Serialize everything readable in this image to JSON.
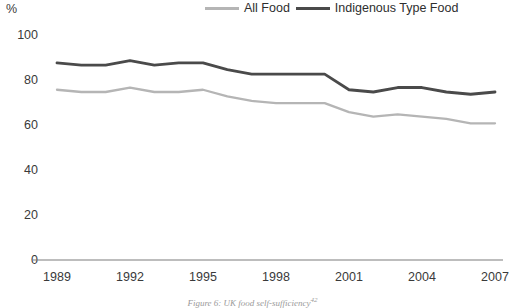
{
  "axis": {
    "unit_label": "%",
    "y_ticks": [
      "100",
      "80",
      "60",
      "40",
      "20",
      "0"
    ],
    "x_ticks": [
      "1989",
      "1992",
      "1995",
      "1998",
      "2001",
      "2004",
      "2007"
    ]
  },
  "legend": {
    "items": [
      {
        "label": "All Food",
        "color": "#b5b5b5",
        "icon": "line-swatch-light"
      },
      {
        "label": "Indigenous Type Food",
        "color": "#4a4a4a",
        "icon": "line-swatch-dark"
      }
    ]
  },
  "caption": {
    "text": "Figure 6: UK food self-sufficiency",
    "footnote": "42"
  },
  "chart_data": {
    "type": "line",
    "title": "UK food self-sufficiency",
    "xlabel": "",
    "ylabel": "%",
    "ylim": [
      0,
      100
    ],
    "xlim": [
      1989,
      2007
    ],
    "grid": false,
    "legend_position": "top-right",
    "x": [
      1989,
      1990,
      1991,
      1992,
      1993,
      1994,
      1995,
      1996,
      1997,
      1998,
      1999,
      2000,
      2001,
      2002,
      2003,
      2004,
      2005,
      2006,
      2007
    ],
    "tick_labels_x": [
      "1989",
      "1992",
      "1995",
      "1998",
      "2001",
      "2004",
      "2007"
    ],
    "tick_labels_y": [
      "0",
      "20",
      "40",
      "60",
      "80",
      "100"
    ],
    "series": [
      {
        "name": "All Food",
        "color": "#b5b5b5",
        "values": [
          76,
          75,
          75,
          77,
          75,
          75,
          76,
          73,
          71,
          70,
          70,
          70,
          66,
          64,
          65,
          64,
          63,
          61,
          61
        ]
      },
      {
        "name": "Indigenous Type Food",
        "color": "#4a4a4a",
        "values": [
          88,
          87,
          87,
          89,
          87,
          88,
          88,
          85,
          83,
          83,
          83,
          83,
          76,
          75,
          77,
          77,
          75,
          74,
          75
        ]
      }
    ]
  }
}
